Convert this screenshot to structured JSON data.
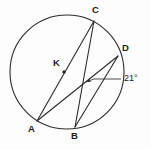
{
  "figure": {
    "type": "circle-geometry-diagram",
    "background_color": "#fdfdfd",
    "stroke_color": "#2b2b2b",
    "label_color": "#1a1a1a",
    "circle": {
      "center_label": "K",
      "cx": 67,
      "cy": 72,
      "r": 57
    },
    "points": [
      {
        "id": "A",
        "label": "A",
        "x": 37,
        "y": 121,
        "label_x": 28,
        "label_y": 126
      },
      {
        "id": "B",
        "label": "B",
        "x": 75,
        "y": 127,
        "label_x": 71,
        "label_y": 133
      },
      {
        "id": "C",
        "label": "C",
        "x": 94,
        "y": 21,
        "label_x": 92,
        "label_y": 8
      },
      {
        "id": "D",
        "label": "D",
        "x": 118,
        "y": 56,
        "label_x": 122,
        "label_y": 45
      },
      {
        "id": "K",
        "label": "K",
        "x": 64,
        "y": 72,
        "label_x": 52,
        "label_y": 58
      }
    ],
    "chords": [
      {
        "name": "chord-CA",
        "from": "C",
        "to": "A"
      },
      {
        "name": "chord-CB",
        "from": "C",
        "to": "B"
      },
      {
        "name": "chord-AD",
        "from": "A",
        "to": "D"
      },
      {
        "name": "chord-BD",
        "from": "B",
        "to": "D"
      }
    ],
    "intersection": {
      "name": "chord-intersection",
      "x": 83,
      "y": 80
    },
    "annotation": {
      "angle_text": "21°",
      "angle_value": 21,
      "angle_unit": "degrees",
      "label_x": 124,
      "label_y": 76,
      "leader_line": {
        "x1": 94,
        "y1": 79,
        "x2": 121,
        "y2": 79
      },
      "arrow_tip": {
        "x": 86,
        "y": 82
      }
    }
  }
}
